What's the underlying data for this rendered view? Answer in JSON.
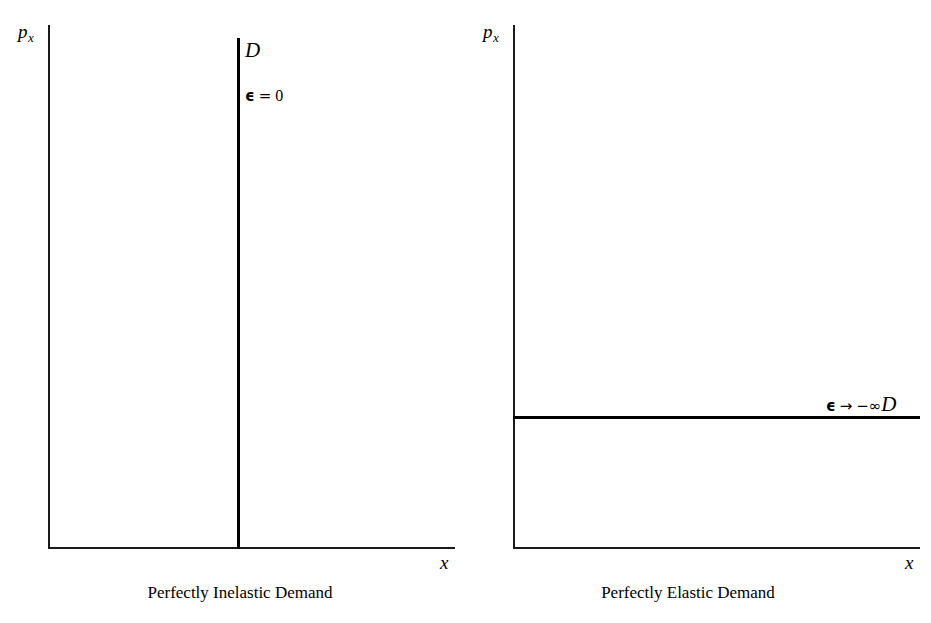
{
  "figure": {
    "panels": [
      {
        "id": "perfectly-inelastic",
        "caption": "Perfectly Inelastic Demand",
        "y_axis_label": "p",
        "y_axis_subscript": "x",
        "x_axis_label": "x",
        "curve_label": "D",
        "elasticity_symbol": "ϵ",
        "elasticity_operator": "=",
        "elasticity_value": "0"
      },
      {
        "id": "perfectly-elastic",
        "caption": "Perfectly Elastic Demand",
        "y_axis_label": "p",
        "y_axis_subscript": "x",
        "x_axis_label": "x",
        "curve_label": "D",
        "elasticity_symbol": "ϵ",
        "elasticity_operator": "→",
        "elasticity_value": "−∞"
      }
    ],
    "colors": {
      "background": "#ffffff",
      "axis": "#1a1a1a",
      "curve": "#000000",
      "text": "#000000"
    }
  },
  "chart_data": [
    {
      "type": "line",
      "title": "Perfectly Inelastic Demand",
      "xlabel": "x",
      "ylabel": "p_x",
      "grid": false,
      "legend": "none",
      "xlim": [
        0,
        100
      ],
      "ylim": [
        0,
        100
      ],
      "annotations": [
        "D",
        "ϵ = 0"
      ],
      "series": [
        {
          "name": "D",
          "orientation": "vertical",
          "x": [
            46.4,
            46.4
          ],
          "y": [
            0,
            97.5
          ],
          "description": "Vertical demand curve at fixed quantity; elasticity equals zero"
        }
      ]
    },
    {
      "type": "line",
      "title": "Perfectly Elastic Demand",
      "xlabel": "x",
      "ylabel": "p_x",
      "grid": false,
      "legend": "none",
      "xlim": [
        0,
        100
      ],
      "ylim": [
        0,
        100
      ],
      "annotations": [
        "ϵ → −∞D"
      ],
      "series": [
        {
          "name": "D",
          "orientation": "horizontal",
          "x": [
            0,
            100
          ],
          "y": [
            25.2,
            25.2
          ],
          "description": "Horizontal demand curve at fixed price; elasticity tends to negative infinity"
        }
      ]
    }
  ]
}
